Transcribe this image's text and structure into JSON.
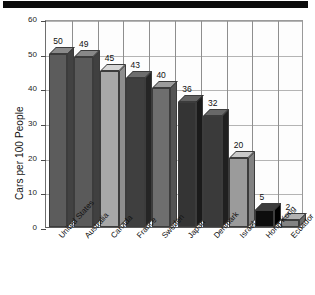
{
  "banner": {
    "name": "top-black-banner"
  },
  "chart_data": {
    "type": "bar",
    "title": "",
    "xlabel": "",
    "ylabel": "Cars per 100 People",
    "ylim": [
      0,
      60
    ],
    "yticks": [
      0,
      10,
      20,
      30,
      40,
      50,
      60
    ],
    "grid": true,
    "legend": "none",
    "categories": [
      "United States",
      "Australia",
      "Canada",
      "France",
      "Sweden",
      "Japan",
      "Denmark",
      "Israel",
      "Hong Kong",
      "Ecuador"
    ],
    "values": [
      50,
      49,
      45,
      43,
      40,
      36,
      32,
      20,
      5,
      2
    ],
    "value_labels": [
      "50",
      "49",
      "45",
      "43",
      "40",
      "36",
      "32",
      "20",
      "5",
      "2"
    ],
    "bar_colors": [
      "#5c5c5c",
      "#5a5a5a",
      "#a8a8a8",
      "#3f3f3f",
      "#6e6e6e",
      "#343434",
      "#3a3a3a",
      "#9b9b9b",
      "#0d0d0d",
      "#838383"
    ]
  },
  "axis": {
    "ytick_labels": [
      "0",
      "10",
      "20",
      "30",
      "40",
      "50",
      "60"
    ]
  }
}
